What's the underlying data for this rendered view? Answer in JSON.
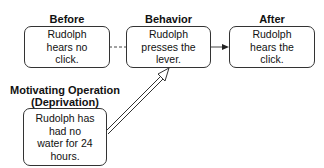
{
  "diagram": {
    "before": {
      "title": "Before",
      "text": "Rudolph\nhears no\nclick."
    },
    "behavior": {
      "title": "Behavior",
      "text": "Rudolph\npresses the\nlever."
    },
    "after": {
      "title": "After",
      "text": "Rudolph\nhears the\nclick."
    },
    "motivating_operation": {
      "title_line1": "Motivating Operation",
      "title_line2": "(Deprivation)",
      "text": "Rudolph has\nhad no\nwater for 24\nhours."
    },
    "connectors": [
      {
        "from": "before",
        "to": "behavior",
        "style": "dashed"
      },
      {
        "from": "behavior",
        "to": "after",
        "style": "solid-arrow"
      },
      {
        "from": "motivating_operation",
        "to": "behavior",
        "style": "double-line-hollow-arrow"
      }
    ]
  }
}
